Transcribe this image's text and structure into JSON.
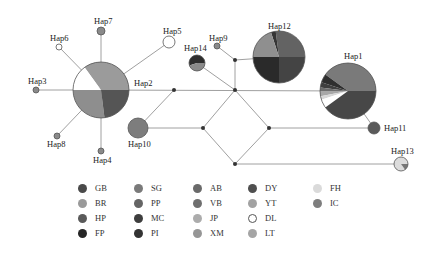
{
  "diagram": {
    "type": "haplotype-network",
    "edge_color": "#a0a0a0",
    "median_node_color": "#333333",
    "haplotypes": [
      {
        "id": "Hap1",
        "label": "Hap1",
        "cx": 348,
        "cy": 91,
        "r": 28,
        "lx": 344,
        "ly": 59,
        "slices": [
          {
            "pop": "SG",
            "color": "#7a7a7a",
            "frac": 0.4
          },
          {
            "pop": "FP",
            "color": "#2e2e2e",
            "frac": 0.05
          },
          {
            "pop": "PI",
            "color": "#3f3f3f",
            "frac": 0.03
          },
          {
            "pop": "VB",
            "color": "#6e6e6e",
            "frac": 0.02
          },
          {
            "pop": "JP",
            "color": "#a8a8a8",
            "frac": 0.03
          },
          {
            "pop": "FH",
            "color": "#d8d8d8",
            "frac": 0.02
          },
          {
            "pop": "DL",
            "color": "#ffffff",
            "frac": 0.05
          },
          {
            "pop": "DY",
            "color": "#474747",
            "frac": 0.4
          }
        ]
      },
      {
        "id": "Hap2",
        "label": "Hap2",
        "cx": 101,
        "cy": 90,
        "r": 28,
        "lx": 134,
        "ly": 86,
        "slices": [
          {
            "pop": "BR",
            "color": "#9b9b9b",
            "frac": 0.35
          },
          {
            "pop": "DL",
            "color": "#ffffff",
            "frac": 0.15
          },
          {
            "pop": "YT",
            "color": "#8e8e8e",
            "frac": 0.27
          },
          {
            "pop": "HP",
            "color": "#555555",
            "frac": 0.23
          }
        ]
      },
      {
        "id": "Hap3",
        "label": "Hap3",
        "cx": 36,
        "cy": 90,
        "r": 3,
        "lx": 28,
        "ly": 84,
        "slices": [
          {
            "pop": "SG",
            "color": "#8a8a8a",
            "frac": 1
          }
        ]
      },
      {
        "id": "Hap4",
        "label": "Hap4",
        "cx": 101,
        "cy": 151,
        "r": 3,
        "lx": 93,
        "ly": 163,
        "slices": [
          {
            "pop": "SG",
            "color": "#8a8a8a",
            "frac": 1
          }
        ]
      },
      {
        "id": "Hap5",
        "label": "Hap5",
        "cx": 169,
        "cy": 42,
        "r": 6,
        "lx": 163,
        "ly": 34,
        "slices": [
          {
            "pop": "DL",
            "color": "#ffffff",
            "frac": 1
          }
        ]
      },
      {
        "id": "Hap6",
        "label": "Hap6",
        "cx": 59,
        "cy": 47,
        "r": 3,
        "lx": 50,
        "ly": 41,
        "slices": [
          {
            "pop": "DL",
            "color": "#ffffff",
            "frac": 1
          }
        ]
      },
      {
        "id": "Hap7",
        "label": "Hap7",
        "cx": 101,
        "cy": 31,
        "r": 4,
        "lx": 94,
        "ly": 24,
        "slices": [
          {
            "pop": "SG",
            "color": "#8a8a8a",
            "frac": 1
          }
        ]
      },
      {
        "id": "Hap8",
        "label": "Hap8",
        "cx": 57,
        "cy": 136,
        "r": 3,
        "lx": 47,
        "ly": 147,
        "slices": [
          {
            "pop": "SG",
            "color": "#8a8a8a",
            "frac": 1
          }
        ]
      },
      {
        "id": "Hap9",
        "label": "Hap9",
        "cx": 217,
        "cy": 46,
        "r": 3,
        "lx": 209,
        "ly": 41,
        "slices": [
          {
            "pop": "SG",
            "color": "#8a8a8a",
            "frac": 1
          }
        ]
      },
      {
        "id": "Hap10",
        "label": "Hap10",
        "cx": 138,
        "cy": 128,
        "r": 10,
        "lx": 128,
        "ly": 147,
        "slices": [
          {
            "pop": "IC",
            "color": "#7d7d7d",
            "frac": 1
          }
        ]
      },
      {
        "id": "Hap11",
        "label": "Hap11",
        "cx": 374,
        "cy": 128,
        "r": 6,
        "lx": 384,
        "ly": 131,
        "slices": [
          {
            "pop": "GB",
            "color": "#5a5a5a",
            "frac": 1
          }
        ]
      },
      {
        "id": "Hap12",
        "label": "Hap12",
        "cx": 279,
        "cy": 57,
        "r": 26,
        "lx": 268,
        "ly": 29,
        "slices": [
          {
            "pop": "SG",
            "color": "#636363",
            "frac": 0.27
          },
          {
            "pop": "PI",
            "color": "#353535",
            "frac": 0.03
          },
          {
            "pop": "XM",
            "color": "#8f8f8f",
            "frac": 0.2
          },
          {
            "pop": "FP",
            "color": "#2a2a2a",
            "frac": 0.25
          },
          {
            "pop": "DY",
            "color": "#444444",
            "frac": 0.25
          }
        ]
      },
      {
        "id": "Hap13",
        "label": "Hap13",
        "cx": 401,
        "cy": 164,
        "r": 7,
        "lx": 391,
        "ly": 154,
        "slices": [
          {
            "pop": "FH",
            "color": "#dcdcdc",
            "frac": 0.85
          },
          {
            "pop": "SG",
            "color": "#777777",
            "frac": 0.15
          }
        ]
      },
      {
        "id": "Hap14",
        "label": "Hap14",
        "cx": 197,
        "cy": 63,
        "r": 8,
        "lx": 184,
        "ly": 51,
        "slices": [
          {
            "pop": "FP",
            "color": "#2e2e2e",
            "frac": 0.55
          },
          {
            "pop": "BR",
            "color": "#8a8a8a",
            "frac": 0.45
          }
        ]
      }
    ],
    "median_vectors": [
      {
        "id": "mv1",
        "cx": 174,
        "cy": 90
      },
      {
        "id": "mv2",
        "cx": 235,
        "cy": 90
      },
      {
        "id": "mv3",
        "cx": 235,
        "cy": 60
      },
      {
        "id": "mv4",
        "cx": 203,
        "cy": 128
      },
      {
        "id": "mv5",
        "cx": 269,
        "cy": 128
      },
      {
        "id": "mv6",
        "cx": 235,
        "cy": 164
      }
    ],
    "edges": [
      [
        101,
        90,
        36,
        90
      ],
      [
        101,
        90,
        101,
        31
      ],
      [
        101,
        90,
        101,
        151
      ],
      [
        101,
        90,
        59,
        47
      ],
      [
        101,
        90,
        57,
        136
      ],
      [
        101,
        90,
        169,
        42
      ],
      [
        101,
        90,
        348,
        91
      ],
      [
        174,
        90,
        138,
        128
      ],
      [
        148,
        128,
        203,
        128
      ],
      [
        235,
        90,
        197,
        63
      ],
      [
        235,
        90,
        235,
        60
      ],
      [
        235,
        60,
        217,
        46
      ],
      [
        235,
        60,
        279,
        57
      ],
      [
        235,
        90,
        203,
        128
      ],
      [
        235,
        90,
        269,
        128
      ],
      [
        203,
        128,
        235,
        164
      ],
      [
        269,
        128,
        235,
        164
      ],
      [
        269,
        128,
        374,
        128
      ],
      [
        348,
        91,
        374,
        128
      ],
      [
        235,
        164,
        401,
        164
      ]
    ]
  },
  "legend": {
    "columns": [
      [
        {
          "code": "GB",
          "color": "#4a4a4a"
        },
        {
          "code": "BR",
          "color": "#9a9a9a"
        },
        {
          "code": "HP",
          "color": "#5a5a5a"
        },
        {
          "code": "FP",
          "color": "#262626"
        }
      ],
      [
        {
          "code": "SG",
          "color": "#7a7a7a"
        },
        {
          "code": "PP",
          "color": "#656565"
        },
        {
          "code": "MC",
          "color": "#3e3e3e"
        },
        {
          "code": "PI",
          "color": "#333333"
        }
      ],
      [
        {
          "code": "AB",
          "color": "#6a6a6a"
        },
        {
          "code": "VB",
          "color": "#6f6f6f"
        },
        {
          "code": "JP",
          "color": "#acacac"
        },
        {
          "code": "XM",
          "color": "#969696"
        }
      ],
      [
        {
          "code": "DY",
          "color": "#4f4f4f"
        },
        {
          "code": "YT",
          "color": "#a2a2a2"
        },
        {
          "code": "DL",
          "color": "#ffffff"
        },
        {
          "code": "LT",
          "color": "#a5a5a5"
        }
      ],
      [
        {
          "code": "FH",
          "color": "#dadada"
        },
        {
          "code": "IC",
          "color": "#7e7e7e"
        }
      ]
    ]
  }
}
